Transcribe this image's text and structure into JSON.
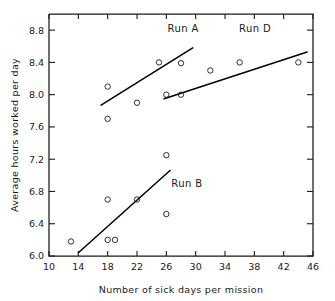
{
  "chart_data": {
    "type": "scatter",
    "title": "",
    "xlabel": "Number of sick days per mission",
    "ylabel": "Average hours worked per day",
    "xlim": [
      10,
      46
    ],
    "ylim": [
      6.0,
      9.0
    ],
    "xticks": [
      10,
      14,
      18,
      22,
      26,
      30,
      34,
      38,
      42,
      46
    ],
    "yticks": [
      6.0,
      6.4,
      6.8,
      7.2,
      7.6,
      8.0,
      8.4,
      8.8
    ],
    "xtick_labels": [
      "10",
      "14",
      "18",
      "22",
      "26",
      "30",
      "34",
      "38",
      "42",
      "46"
    ],
    "ytick_labels": [
      "6.0",
      "6.4",
      "6.8",
      "7.2",
      "7.6",
      "8.0",
      "8.4",
      "8.8"
    ],
    "grid": false,
    "legend_position": "inline-annotations",
    "marker": "open-circle",
    "points": [
      {
        "x": 13,
        "y": 6.18
      },
      {
        "x": 18,
        "y": 6.2
      },
      {
        "x": 19,
        "y": 6.2
      },
      {
        "x": 18,
        "y": 6.7
      },
      {
        "x": 22,
        "y": 6.7
      },
      {
        "x": 26,
        "y": 6.52
      },
      {
        "x": 26,
        "y": 7.25
      },
      {
        "x": 18,
        "y": 7.7
      },
      {
        "x": 22,
        "y": 7.9
      },
      {
        "x": 18,
        "y": 8.1
      },
      {
        "x": 25,
        "y": 8.4
      },
      {
        "x": 28,
        "y": 8.39
      },
      {
        "x": 26,
        "y": 8.0
      },
      {
        "x": 28,
        "y": 8.0
      },
      {
        "x": 32,
        "y": 8.3
      },
      {
        "x": 36,
        "y": 8.4
      },
      {
        "x": 44,
        "y": 8.4
      }
    ],
    "series": [
      {
        "name": "Run A",
        "label": "Run A",
        "label_x": 28.3,
        "label_y": 8.78,
        "fit_line": {
          "x1": 17.1,
          "y1": 7.87,
          "x2": 29.6,
          "y2": 8.58
        }
      },
      {
        "name": "Run B",
        "label": "Run B",
        "label_x": 28.8,
        "label_y": 6.86,
        "fit_line": {
          "x1": 14.0,
          "y1": 6.04,
          "x2": 26.5,
          "y2": 7.06
        }
      },
      {
        "name": "Run D",
        "label": "Run D",
        "label_x": 38.1,
        "label_y": 8.78,
        "fit_line": {
          "x1": 25.7,
          "y1": 7.95,
          "x2": 45.2,
          "y2": 8.53
        }
      }
    ]
  },
  "axes": {
    "plot_left_px": 49,
    "plot_right_px": 313,
    "plot_top_px": 14,
    "plot_bottom_px": 256
  },
  "colors": {
    "ink": "#1a1a1a",
    "line": "#000000",
    "background": "#ffffff"
  }
}
